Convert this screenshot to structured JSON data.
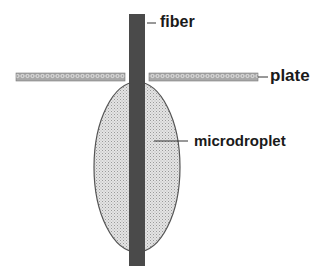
{
  "diagram": {
    "type": "schematic",
    "elements": [
      {
        "id": "fiber",
        "label": "fiber",
        "shape": "vertical bar",
        "color": "#4a4a4a"
      },
      {
        "id": "plate",
        "label": "plate",
        "shape": "horizontal bar with gap for fiber",
        "pattern": "hatched",
        "color": "#8a8a8a"
      },
      {
        "id": "microdroplet",
        "label": "microdroplet",
        "shape": "ellipse around fiber below plate",
        "pattern": "dotted",
        "fill": "#d6d6d6",
        "stroke": "#555555"
      }
    ]
  },
  "labels": {
    "fiber": "fiber",
    "plate": "plate",
    "microdroplet": "microdroplet"
  },
  "colors": {
    "fiber": "#4a4a4a",
    "plate_fill": "#9a9a9a",
    "droplet_fill": "#d9d9d9",
    "droplet_stroke": "#555555",
    "leader_line": "#333333"
  }
}
